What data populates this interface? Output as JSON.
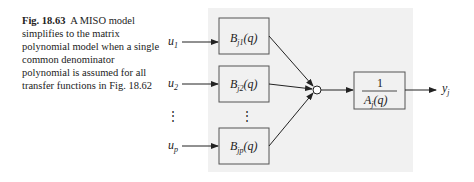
{
  "caption": {
    "figure_label": "Fig. 18.63",
    "text": "A MISO model simplifies to the matrix polynomial model when a single common denominator polynomial is assumed for all transfer functions in Fig. 18.62"
  },
  "diagram": {
    "inputs": [
      {
        "name": "u",
        "sub": "1"
      },
      {
        "name": "u",
        "sub": "2"
      },
      {
        "name": "u",
        "sub": "p"
      }
    ],
    "blocks": [
      {
        "name": "B",
        "sub": "j1",
        "arg": "(q)"
      },
      {
        "name": "B",
        "sub": "j2",
        "arg": "(q)"
      },
      {
        "name": "B",
        "sub": "jp",
        "arg": "(q)"
      }
    ],
    "ellipsis": "⋮",
    "denominator_block": {
      "numerator": "1",
      "name": "A",
      "sub": "j",
      "arg": "(q)"
    },
    "output": {
      "name": "y",
      "sub": "j"
    }
  }
}
